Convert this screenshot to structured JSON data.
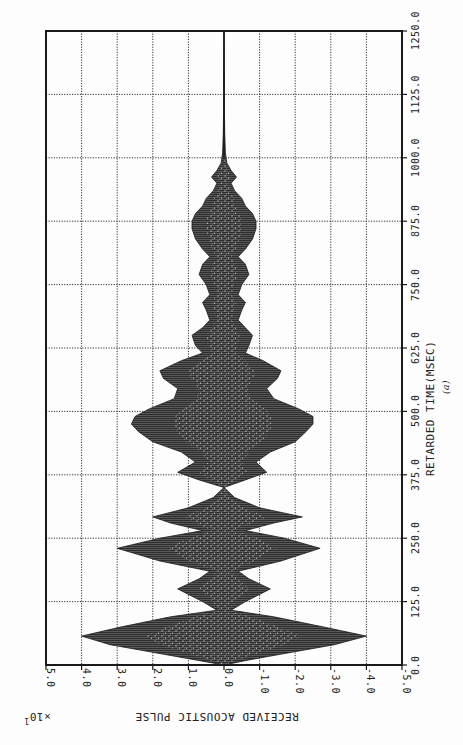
{
  "chart_data": {
    "type": "area",
    "title": "",
    "caption": "(a)",
    "xlabel": "RETARDED TIME(MSEC)",
    "ylabel": "RECEIVED ACOUSTIC PULSE",
    "y_scale_label": "×10",
    "y_scale_exponent": "1",
    "xlim": [
      0.0,
      1250.0
    ],
    "ylim": [
      -5.0,
      5.0
    ],
    "x_ticks": [
      "0.0",
      "125.0",
      "250.0",
      "375.0",
      "500.0",
      "625.0",
      "750.0",
      "875.0",
      "1000.0",
      "1125.0",
      "1250.0"
    ],
    "y_ticks": [
      "5.0",
      "4.0",
      "3.0",
      "2.0",
      "1.0",
      "0.0",
      "-1.0",
      "-2.0",
      "-3.0",
      "-4.0",
      "-5.0"
    ],
    "grid": true,
    "orientation": "rotated 90 degrees (time axis vertical, increasing upward)",
    "series": [
      {
        "name": "envelope_upper",
        "x": [
          0,
          10,
          25,
          40,
          57,
          75,
          95,
          108,
          125,
          150,
          170,
          185,
          205,
          230,
          250,
          265,
          280,
          292,
          310,
          330,
          350,
          365,
          380,
          400,
          420,
          440,
          460,
          475,
          490,
          505,
          525,
          545,
          565,
          580,
          600,
          615,
          630,
          650,
          665,
          680,
          700,
          715,
          730,
          750,
          770,
          790,
          805,
          820,
          840,
          860,
          875,
          890,
          905,
          920,
          935,
          950,
          962,
          975,
          990,
          1010,
          1050,
          1100,
          1250
        ],
        "values": [
          0.0,
          0.8,
          2.0,
          3.2,
          4.0,
          2.9,
          1.5,
          0.2,
          0.6,
          1.3,
          0.7,
          0.4,
          1.8,
          3.0,
          1.8,
          0.6,
          1.5,
          2.0,
          1.0,
          0.3,
          0.0,
          0.7,
          1.3,
          0.8,
          1.2,
          2.0,
          2.4,
          2.6,
          2.5,
          2.1,
          1.4,
          1.3,
          1.7,
          1.8,
          1.2,
          0.6,
          0.8,
          0.9,
          0.6,
          0.4,
          0.5,
          0.6,
          0.4,
          0.5,
          0.7,
          0.6,
          0.4,
          0.6,
          0.8,
          0.9,
          0.9,
          0.8,
          0.6,
          0.5,
          0.3,
          0.2,
          0.35,
          0.2,
          0.08,
          0.04,
          0.02,
          0.01,
          0.0
        ]
      },
      {
        "name": "envelope_lower",
        "x": [
          0,
          10,
          25,
          40,
          57,
          75,
          95,
          108,
          125,
          150,
          170,
          185,
          205,
          230,
          250,
          265,
          280,
          292,
          310,
          330,
          350,
          365,
          380,
          400,
          420,
          440,
          460,
          475,
          490,
          505,
          525,
          545,
          565,
          580,
          600,
          615,
          630,
          650,
          665,
          680,
          700,
          715,
          730,
          750,
          770,
          790,
          805,
          820,
          840,
          860,
          875,
          890,
          905,
          920,
          935,
          950,
          962,
          975,
          990,
          1010,
          1050,
          1100,
          1250
        ],
        "values": [
          0.0,
          -0.7,
          -1.9,
          -3.1,
          -4.0,
          -2.8,
          -1.4,
          -0.2,
          -0.6,
          -1.3,
          -0.7,
          -0.4,
          -1.6,
          -2.7,
          -1.7,
          -0.6,
          -1.4,
          -2.2,
          -1.0,
          -0.3,
          0.0,
          -0.6,
          -1.2,
          -0.9,
          -1.3,
          -2.0,
          -2.3,
          -2.5,
          -2.5,
          -2.1,
          -1.4,
          -1.2,
          -1.5,
          -1.6,
          -1.1,
          -0.6,
          -0.7,
          -0.8,
          -0.6,
          -0.4,
          -0.5,
          -0.6,
          -0.4,
          -0.5,
          -0.7,
          -0.6,
          -0.4,
          -0.6,
          -0.8,
          -0.9,
          -0.9,
          -0.8,
          -0.6,
          -0.5,
          -0.3,
          -0.2,
          -0.35,
          -0.2,
          -0.08,
          -0.04,
          -0.02,
          -0.01,
          0.0
        ]
      }
    ]
  },
  "colors": {
    "ink": "#1a1a1a",
    "fill": "#3a3a3a",
    "speckle": "#bdbdbd",
    "grid": "#333333",
    "paper": "#fdfdfd"
  }
}
